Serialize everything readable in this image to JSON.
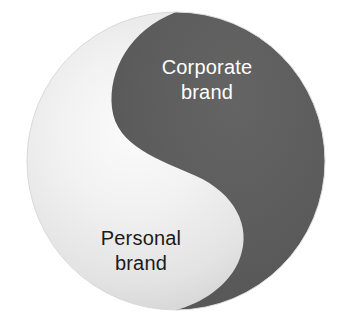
{
  "diagram": {
    "type": "yin-yang",
    "shape": "circle",
    "regions": [
      {
        "id": "corporate",
        "label_line1": "Corporate",
        "label_line2": "brand",
        "fill_color": "#5c5c5c",
        "text_color": "#ffffff",
        "position": "upper-right"
      },
      {
        "id": "personal",
        "label_line1": "Personal",
        "label_line2": "brand",
        "fill_color": "#eeeeee",
        "text_color": "#1b1b1b",
        "position": "lower-left"
      }
    ],
    "colors": {
      "background": "#ffffff",
      "dark_gray": "#5c5c5c",
      "dark_gray_edge": "#585858",
      "light_gray_highlight": "#f4f4f4",
      "light_gray_mid": "#dcdcdc",
      "light_gray_edge": "#b2b2b2",
      "text_dark": "#1b1b1b",
      "text_light": "#ffffff"
    },
    "geometry": {
      "center_x": 176,
      "center_y": 161,
      "radius": 149
    }
  }
}
